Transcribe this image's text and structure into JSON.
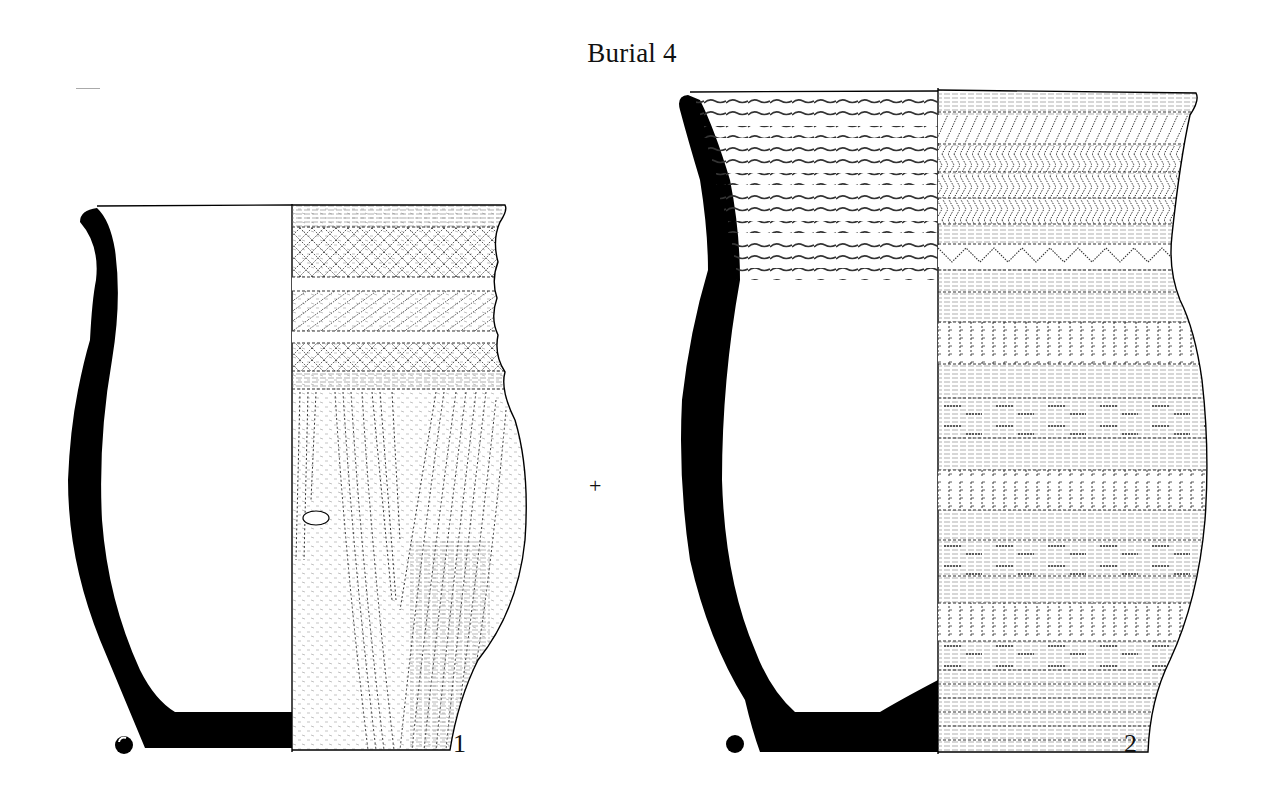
{
  "plate": {
    "title": "Burial 4",
    "center_mark": "+",
    "colors": {
      "ink": "#000000",
      "paper": "#ffffff",
      "hatch": "#333333"
    }
  },
  "vessels": [
    {
      "number": "1",
      "type": "beaker",
      "section_symbol": "half-filled-circle",
      "decoration_zones": [
        "rim band: horizontal lines",
        "zone 1: lattice cross-hatching",
        "rib",
        "zone 2: diagonal hatching",
        "rib",
        "zone 3: lattice cross-hatching",
        "rib",
        "body: vertical / oblique comb-impressed lines forming V",
        "applied lug on body"
      ]
    },
    {
      "number": "2",
      "type": "beaker",
      "section_symbol": "filled-circle",
      "interior_rim_decoration": "12 twisted cord lines",
      "decoration_zones": [
        "rim band: horizontal lines",
        "zone 1: diagonal hatching",
        "zone 2: herringbone",
        "zone 3: herringbone",
        "zone 4: herringbone",
        "zone 5: zigzag triangles",
        "alternating body bands: vertical comb-impressed, plain, horizontal dashes"
      ]
    }
  ]
}
